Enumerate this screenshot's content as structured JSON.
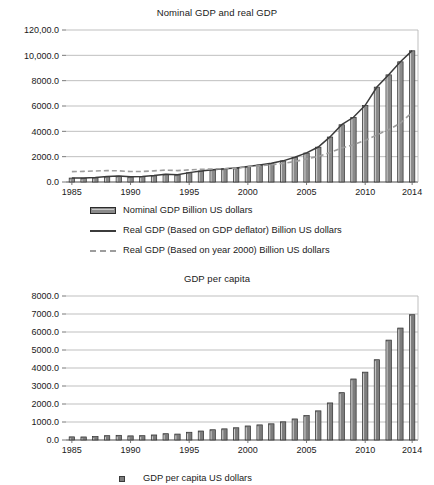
{
  "chart_data": [
    {
      "id": "nominal-real-gdp",
      "type": "bar",
      "title": "Nominal GDP and real GDP",
      "xlabel": "",
      "ylabel": "",
      "ylim": [
        0,
        12000
      ],
      "ytick_labels": [
        "120,00.0",
        "10,000.0",
        "8000.0",
        "6000.0",
        "4000.0",
        "2000.0",
        "0.0"
      ],
      "ytick_values": [
        12000,
        10000,
        8000,
        6000,
        4000,
        2000,
        0
      ],
      "xtick_labels": [
        "1985",
        "1990",
        "1995",
        "2000",
        "2005",
        "2010",
        "2014"
      ],
      "xtick_years": [
        1985,
        1990,
        1995,
        2000,
        2005,
        2010,
        2014
      ],
      "grid": true,
      "legend_position": "bottom",
      "categories": [
        1985,
        1986,
        1987,
        1988,
        1989,
        1990,
        1991,
        1992,
        1993,
        1994,
        1995,
        1996,
        1997,
        1998,
        1999,
        2000,
        2001,
        2002,
        2003,
        2004,
        2005,
        2006,
        2007,
        2008,
        2009,
        2010,
        2011,
        2012,
        2013,
        2014
      ],
      "series": [
        {
          "name": "Nominal GDP Billion US dollars",
          "marker": "bar",
          "color": "#8a8a8a",
          "values": [
            310,
            300,
            330,
            410,
            460,
            400,
            420,
            490,
            610,
            560,
            730,
            860,
            960,
            1030,
            1090,
            1210,
            1340,
            1470,
            1660,
            1950,
            2290,
            2750,
            3550,
            4520,
            5100,
            6040,
            7490,
            8460,
            9490,
            10360
          ]
        },
        {
          "name": "Real GDP (Based on GDP deflator) Billion US dollars",
          "marker": "line",
          "color": "#3b3b3b",
          "values": [
            320,
            320,
            350,
            430,
            470,
            420,
            440,
            510,
            620,
            580,
            740,
            870,
            970,
            1040,
            1100,
            1220,
            1350,
            1480,
            1670,
            1960,
            2300,
            2760,
            3560,
            4530,
            5110,
            6050,
            7500,
            8470,
            9500,
            10370
          ]
        },
        {
          "name": "Real GDP (Based on year 2000) Billion US dollars",
          "marker": "dashed",
          "color": "#9d9d9d",
          "values": [
            820,
            840,
            870,
            900,
            880,
            830,
            830,
            880,
            940,
            900,
            960,
            1000,
            1030,
            1050,
            1080,
            1210,
            1280,
            1360,
            1470,
            1620,
            1810,
            2030,
            2320,
            2690,
            2940,
            3280,
            3720,
            4130,
            4650,
            5500
          ]
        }
      ]
    },
    {
      "id": "gdp-per-capita",
      "type": "bar",
      "title": "GDP per capita",
      "xlabel": "",
      "ylabel": "",
      "ylim": [
        0,
        8000
      ],
      "ytick_labels": [
        "8000.0",
        "7000.0",
        "6000.0",
        "5000.0",
        "4000.0",
        "3000.0",
        "2000.0",
        "1000.0",
        "0.0"
      ],
      "ytick_values": [
        8000,
        7000,
        6000,
        5000,
        4000,
        3000,
        2000,
        1000,
        0
      ],
      "xtick_labels": [
        "1985",
        "1990",
        "1995",
        "2000",
        "2005",
        "2010",
        "2014"
      ],
      "xtick_years": [
        1985,
        1990,
        1995,
        2000,
        2005,
        2010,
        2014
      ],
      "grid": true,
      "legend_position": "bottom",
      "categories": [
        1985,
        1986,
        1987,
        1988,
        1989,
        1990,
        1991,
        1992,
        1993,
        1994,
        1995,
        1996,
        1997,
        1998,
        1999,
        2000,
        2001,
        2002,
        2003,
        2004,
        2005,
        2006,
        2007,
        2008,
        2009,
        2010,
        2011,
        2012,
        2013,
        2014
      ],
      "series": [
        {
          "name": "GDP per capita  US dollars",
          "marker": "bar",
          "color": "#7d7d7d",
          "values": [
            175,
            170,
            190,
            240,
            260,
            230,
            240,
            280,
            350,
            330,
            430,
            500,
            570,
            620,
            680,
            780,
            840,
            900,
            1010,
            1170,
            1360,
            1620,
            2060,
            2630,
            3390,
            3770,
            4460,
            5550,
            6220,
            6960
          ]
        }
      ]
    }
  ],
  "top": {
    "title": "Nominal GDP and real GDP",
    "legend": [
      {
        "label": "Nominal GDP Billion US dollars",
        "key": "bar-swatch"
      },
      {
        "label": "Real GDP (Based on GDP deflator) Billion US dollars",
        "key": "solid-line-swatch"
      },
      {
        "label": "Real GDP (Based on year 2000) Billion US dollars",
        "key": "dashed-line-swatch"
      }
    ]
  },
  "bottom": {
    "title": "GDP per capita",
    "legend": [
      {
        "label": "GDP per capita  US dollars",
        "key": "square-swatch"
      }
    ]
  }
}
